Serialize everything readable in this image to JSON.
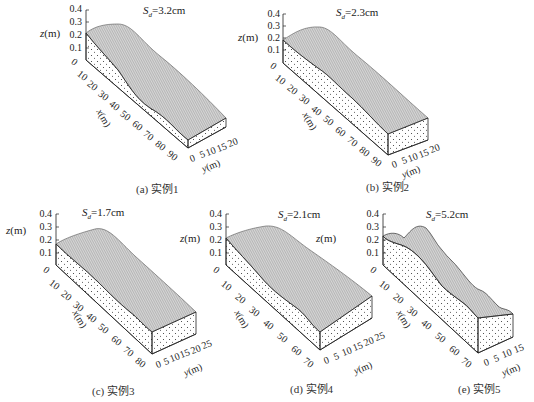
{
  "figure": {
    "panels": [
      {
        "id": "a",
        "caption": "(a) 实例1",
        "sd_symbol": "S",
        "sd_sub": "d",
        "sd_value": "=3.2cm",
        "z_label": "z",
        "z_unit": "(m)",
        "z_ticks": [
          "0.4",
          "0.3",
          "0.2",
          "0.1",
          "0"
        ],
        "x_label": "x",
        "x_unit": "(m)",
        "x_ticks": [
          "10",
          "20",
          "30",
          "40",
          "50",
          "60",
          "70",
          "80",
          "90"
        ],
        "y_label": "y",
        "y_unit": "(m)",
        "y_ticks": [
          "0",
          "5",
          "10",
          "15",
          "20"
        ]
      },
      {
        "id": "b",
        "caption": "(b) 实例2",
        "sd_symbol": "S",
        "sd_sub": "d",
        "sd_value": "=2.3cm",
        "z_label": "z",
        "z_unit": "(m)",
        "z_ticks": [
          "0.4",
          "0.3",
          "0.2",
          "0.1",
          "0"
        ],
        "x_label": "x",
        "x_unit": "(m)",
        "x_ticks": [
          "10",
          "20",
          "30",
          "40",
          "50",
          "60",
          "70",
          "80",
          "90"
        ],
        "y_label": "y",
        "y_unit": "(m)",
        "y_ticks": [
          "0",
          "5",
          "10",
          "15",
          "20"
        ]
      },
      {
        "id": "c",
        "caption": "(c) 实例3",
        "sd_symbol": "S",
        "sd_sub": "d",
        "sd_value": "=1.7cm",
        "z_label": "z",
        "z_unit": "(m)",
        "z_ticks": [
          "0.4",
          "0.3",
          "0.2",
          "0.1",
          "0"
        ],
        "x_label": "x",
        "x_unit": "(m)",
        "x_ticks": [
          "10",
          "20",
          "30",
          "40",
          "50",
          "60",
          "70",
          "80"
        ],
        "y_label": "y",
        "y_unit": "(m)",
        "y_ticks": [
          "0",
          "5",
          "10",
          "15",
          "20",
          "25"
        ]
      },
      {
        "id": "d",
        "caption": "(d) 实例4",
        "sd_symbol": "S",
        "sd_sub": "d",
        "sd_value": "=2.1cm",
        "z_label": "z",
        "z_unit": "(m)",
        "z_ticks": [
          "0.4",
          "0.3",
          "0.2",
          "0.1",
          "0"
        ],
        "x_label": "x",
        "x_unit": "(m)",
        "x_ticks": [
          "10",
          "20",
          "30",
          "40",
          "50",
          "60",
          "70"
        ],
        "y_label": "y",
        "y_unit": "(m)",
        "y_ticks": [
          "0",
          "5",
          "10",
          "15",
          "20",
          "25"
        ]
      },
      {
        "id": "e",
        "caption": "(e) 实例5",
        "sd_symbol": "S",
        "sd_sub": "d",
        "sd_value": "=5.2cm",
        "z_label": "z",
        "z_unit": "(m)",
        "z_ticks": [
          "0.4",
          "0.3",
          "0.2",
          "0.1",
          "0"
        ],
        "x_label": "x",
        "x_unit": "(m)",
        "x_ticks": [
          "10",
          "20",
          "30",
          "40",
          "50",
          "60",
          "70"
        ],
        "y_label": "y",
        "y_unit": "(m)",
        "y_ticks": [
          "0",
          "5",
          "10",
          "15"
        ]
      }
    ]
  },
  "colors": {
    "surface_fill": "#c8c8c8",
    "surface_lines": "#555555",
    "axis": "#222222",
    "soil_dots": "#333333"
  }
}
